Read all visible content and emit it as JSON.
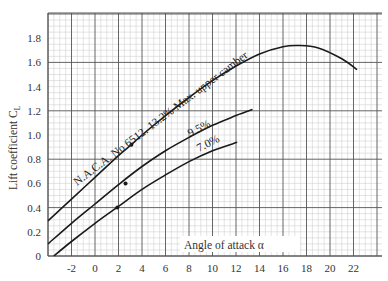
{
  "chart_data": {
    "type": "line",
    "title": "",
    "xlabel": "Angle of attack α",
    "ylabel": "Lift coefficient C_L",
    "ylabel_main": "Lift coefficient C",
    "ylabel_sub": "L",
    "xlim": [
      -4,
      24.4
    ],
    "ylim": [
      0,
      2.0
    ],
    "grid": true,
    "x_ticks": [
      "-2",
      "0",
      "2",
      "4",
      "6",
      "8",
      "10",
      "12",
      "14",
      "16",
      "18",
      "20",
      "22"
    ],
    "y_ticks": [
      "0",
      "0.2",
      "0.4",
      "0.6",
      "0.8",
      "1.0",
      "1.2",
      "1.4",
      "1.6",
      "1.8"
    ],
    "series": [
      {
        "name": "N.A.C.A. No 6512. 13.2% Max. upper camber",
        "label": "N.A.C.A. No 6512. 13.2% Max. upper camber",
        "x": [
          -4,
          -2,
          0,
          2,
          3.1,
          4,
          6,
          8,
          10,
          12,
          14,
          16,
          17.3,
          19,
          21,
          22.3
        ],
        "y": [
          0.29,
          0.47,
          0.65,
          0.83,
          0.92,
          1.0,
          1.16,
          1.31,
          1.45,
          1.57,
          1.67,
          1.73,
          1.74,
          1.72,
          1.63,
          1.54
        ],
        "marker": {
          "x": 3.1,
          "y": 0.92
        }
      },
      {
        "name": "9.5%",
        "label": "9.5%",
        "x": [
          -4,
          -2,
          0,
          2,
          4,
          6,
          8,
          10,
          12,
          13.4
        ],
        "y": [
          0.1,
          0.27,
          0.43,
          0.59,
          0.74,
          0.87,
          0.98,
          1.08,
          1.16,
          1.21
        ],
        "marker": {
          "x": 2.6,
          "y": 0.6
        }
      },
      {
        "name": "7.0%",
        "label": "7.0%",
        "x": [
          -3.5,
          -2,
          0,
          2,
          4,
          6,
          8,
          10,
          12.1
        ],
        "y": [
          0.0,
          0.12,
          0.27,
          0.41,
          0.55,
          0.67,
          0.78,
          0.87,
          0.94
        ],
        "marker": {
          "x": 1.9,
          "y": 0.4
        }
      }
    ]
  },
  "colors": {
    "grid_minor": "#c9c9c9",
    "grid_major": "#555555",
    "curve": "#1a1a1a"
  }
}
